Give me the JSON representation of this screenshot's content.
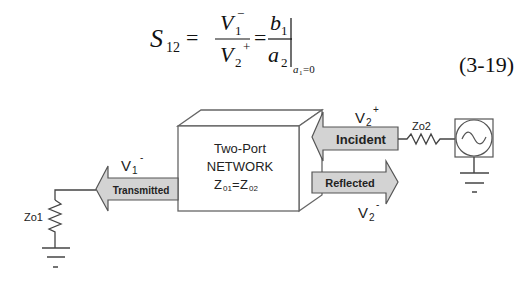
{
  "equation": {
    "lhs": "S",
    "lhs_sub": "12",
    "eq": "=",
    "frac1": {
      "num": "V",
      "num_sub": "1",
      "num_sup": "−",
      "den": "V",
      "den_sub": "2",
      "den_sup": "+"
    },
    "frac2": {
      "num": "b",
      "num_sub": "1",
      "den": "a",
      "den_sub": "2"
    },
    "condition": "a",
    "condition_sub": "1",
    "condition_rest": "=0",
    "number": "(3-19)"
  },
  "diagram": {
    "network": {
      "line1": "Two-Port",
      "line2": "NETWORK",
      "line3_a": "Z",
      "line3_a_sub": "01",
      "line3_eq": "=",
      "line3_b": "Z",
      "line3_b_sub": "02"
    },
    "arrows": {
      "incident": "Incident",
      "reflected": "Reflected",
      "transmitted": "Transmitted"
    },
    "labels": {
      "v2_plus": {
        "base": "V",
        "sub": "2",
        "sup": "+"
      },
      "v2_minus": {
        "base": "V",
        "sub": "2",
        "sup": "-"
      },
      "v1_minus": {
        "base": "V",
        "sub": "1",
        "sup": "-"
      }
    },
    "components": {
      "zo1": "Zo1",
      "zo2": "Zo2",
      "source_icon": "ac-source-icon",
      "ground_icon": "ground-icon",
      "resistor_icon": "resistor-icon"
    },
    "colors": {
      "arrow_fill": "#d3d3d3",
      "line": "#444444"
    }
  }
}
